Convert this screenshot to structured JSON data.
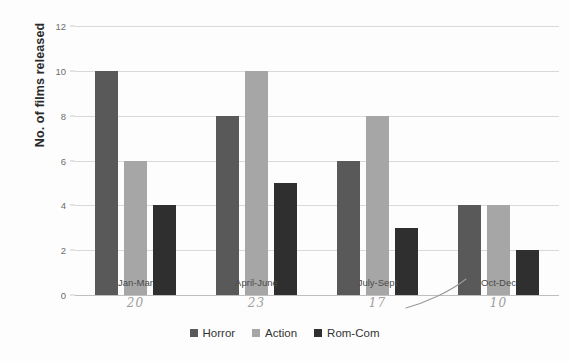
{
  "chart_data": {
    "type": "bar",
    "title": "",
    "subtitle": "",
    "xlabel": "",
    "ylabel": "No. of films released",
    "categories": [
      "Jan-Mar",
      "April-June",
      "July-Sept",
      "Oct-Dec"
    ],
    "series": [
      {
        "name": "Horror",
        "color": "#595959",
        "values": [
          10,
          8,
          6,
          4
        ]
      },
      {
        "name": "Action",
        "color": "#a6a6a6",
        "values": [
          6,
          10,
          8,
          4
        ]
      },
      {
        "name": "Rom-Com",
        "color": "#2f2f2f",
        "values": [
          4,
          5,
          3,
          2
        ]
      }
    ],
    "ylim": [
      0,
      12
    ],
    "y_ticks": [
      0,
      2,
      4,
      6,
      8,
      10,
      12
    ],
    "y_tick_labels": [
      "0",
      "2",
      "4",
      "6",
      "8",
      "10",
      "12"
    ],
    "grid": true,
    "legend_position": "bottom"
  },
  "annotations": {
    "handwritten_totals": [
      "20",
      "23",
      "17",
      "10"
    ],
    "handwritten_curve": "pen-stroke-arc"
  }
}
